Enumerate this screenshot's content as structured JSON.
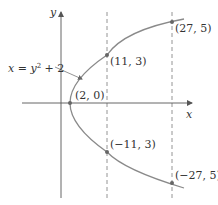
{
  "diagram": {
    "type": "parabola-plot",
    "equation": {
      "lhs": "x",
      "eq": " = ",
      "y": "y",
      "exp": "2",
      "rest": " + 2"
    },
    "axes": {
      "x_label": "x",
      "y_label": "y"
    },
    "points": [
      {
        "label": "(2, 0)",
        "role": "vertex"
      },
      {
        "label": "(11, 3)",
        "role": "upper-inner"
      },
      {
        "label": "(27, 5)",
        "role": "upper-outer"
      },
      {
        "label": "(−11, 3)",
        "role": "lower-inner"
      },
      {
        "label": "(−27, 5)",
        "role": "lower-outer"
      }
    ],
    "colors": {
      "curve": "#8a8a8a",
      "axes": "#555555",
      "dashed": "#888888",
      "points": "#666666",
      "text": "#333333",
      "background": "#ffffff"
    }
  }
}
